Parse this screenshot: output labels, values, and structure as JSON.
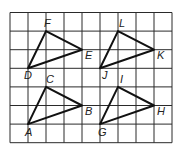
{
  "grid": {
    "cols": 9,
    "rows": 7,
    "x0": 10,
    "y0": 12.5,
    "cell_w": 18,
    "cell_h": 18.6,
    "line_color": "#2a2a2a"
  },
  "triangles": [
    {
      "name": "DEF",
      "vertices": [
        {
          "label": "D",
          "col": 1,
          "row": 3,
          "lx": -4,
          "ly": 11
        },
        {
          "label": "E",
          "col": 4,
          "row": 2,
          "lx": 3,
          "ly": 9
        },
        {
          "label": "F",
          "col": 2,
          "row": 1,
          "lx": -2,
          "ly": -4
        }
      ]
    },
    {
      "name": "JKL",
      "vertices": [
        {
          "label": "J",
          "col": 5,
          "row": 3,
          "lx": 2,
          "ly": 11
        },
        {
          "label": "K",
          "col": 8,
          "row": 2,
          "lx": 3,
          "ly": 9
        },
        {
          "label": "L",
          "col": 6,
          "row": 1,
          "lx": 1,
          "ly": -4
        }
      ]
    },
    {
      "name": "ABC",
      "vertices": [
        {
          "label": "A",
          "col": 1,
          "row": 6,
          "lx": -3,
          "ly": 12
        },
        {
          "label": "B",
          "col": 4,
          "row": 5,
          "lx": 3,
          "ly": 9
        },
        {
          "label": "C",
          "col": 2,
          "row": 4,
          "lx": 0,
          "ly": -4
        }
      ]
    },
    {
      "name": "GHI",
      "vertices": [
        {
          "label": "G",
          "col": 5,
          "row": 6,
          "lx": -2,
          "ly": 12
        },
        {
          "label": "H",
          "col": 8,
          "row": 5,
          "lx": 3,
          "ly": 9
        },
        {
          "label": "I",
          "col": 6,
          "row": 4,
          "lx": 2,
          "ly": -4
        }
      ]
    }
  ]
}
